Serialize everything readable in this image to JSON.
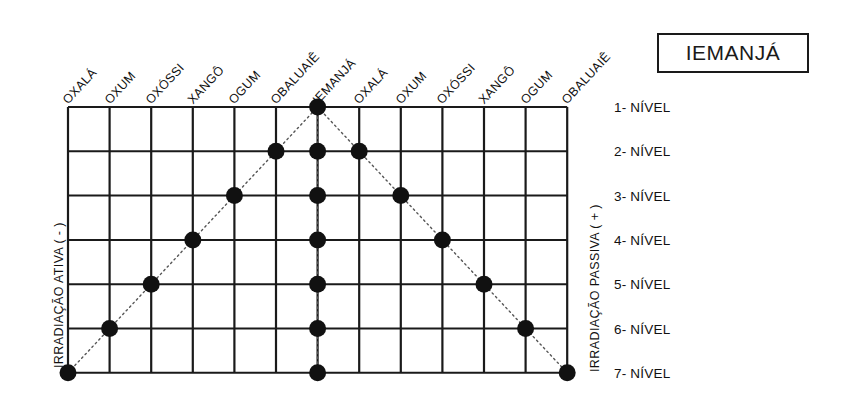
{
  "title": {
    "text": "IEMANJÁ"
  },
  "axes": {
    "left_label": "IRRADIAÇÃO ATIVA ( - )",
    "right_label": "IRRADIAÇÃO PASSIVA ( + )"
  },
  "columns": [
    "OXALÁ",
    "OXUM",
    "OXÓSSI",
    "XANGÔ",
    "OGUM",
    "OBALUAIÊ",
    "IEMANJÁ",
    "OXALÁ",
    "OXUM",
    "OXÓSSI",
    "XANGÔ",
    "OGUM",
    "OBALUAIÊ"
  ],
  "levels": [
    "1- NÍVEL",
    "2- NÍVEL",
    "3- NÍVEL",
    "4- NÍVEL",
    "5- NÍVEL",
    "6- NÍVEL",
    "7- NÍVEL"
  ],
  "chart_data": {
    "type": "scatter",
    "title": "IEMANJÁ",
    "xlabel": "",
    "ylabel": "",
    "categories": [
      "OXALÁ",
      "OXUM",
      "OXÓSSI",
      "XANGÔ",
      "OGUM",
      "OBALUAIÊ",
      "IEMANJÁ",
      "OXALÁ",
      "OXUM",
      "OXÓSSI",
      "XANGÔ",
      "OGUM",
      "OBALUAIÊ"
    ],
    "y_categories": [
      "1- NÍVEL",
      "2- NÍVEL",
      "3- NÍVEL",
      "4- NÍVEL",
      "5- NÍVEL",
      "6- NÍVEL",
      "7- NÍVEL"
    ],
    "grid": true,
    "legend": "none",
    "series": [
      {
        "name": "Irradiação ativa ( - ) — diagonal ascendente",
        "points": [
          {
            "col": 0,
            "level": 7
          },
          {
            "col": 1,
            "level": 6
          },
          {
            "col": 2,
            "level": 5
          },
          {
            "col": 3,
            "level": 4
          },
          {
            "col": 4,
            "level": 3
          },
          {
            "col": 5,
            "level": 2
          },
          {
            "col": 6,
            "level": 1
          }
        ]
      },
      {
        "name": "Eixo central IEMANJÁ",
        "points": [
          {
            "col": 6,
            "level": 1
          },
          {
            "col": 6,
            "level": 2
          },
          {
            "col": 6,
            "level": 3
          },
          {
            "col": 6,
            "level": 4
          },
          {
            "col": 6,
            "level": 5
          },
          {
            "col": 6,
            "level": 6
          },
          {
            "col": 6,
            "level": 7
          }
        ]
      },
      {
        "name": "Irradiação passiva ( + ) — diagonal descendente",
        "points": [
          {
            "col": 6,
            "level": 1
          },
          {
            "col": 7,
            "level": 2
          },
          {
            "col": 8,
            "level": 3
          },
          {
            "col": 9,
            "level": 4
          },
          {
            "col": 10,
            "level": 5
          },
          {
            "col": 11,
            "level": 6
          },
          {
            "col": 12,
            "level": 7
          }
        ]
      }
    ],
    "colors": {
      "marker": "#111111",
      "grid_line": "#1a1a1a",
      "connector": "#555555",
      "background": "#ffffff"
    }
  },
  "geometry": {
    "x0": 68,
    "dx": 41.6,
    "y0": 107,
    "dy": 44.3,
    "cols": 13,
    "rows": 7,
    "dot_radius": 8.5
  }
}
